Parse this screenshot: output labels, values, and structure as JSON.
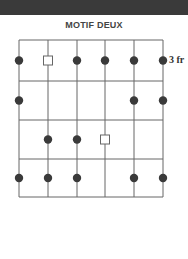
{
  "title": "MOTIF DEUX",
  "fret_label": "3 fr",
  "colors": {
    "grid": "#666666",
    "dot": "#3a3a3a",
    "topbar": "#3a3a3a"
  },
  "diagram": {
    "strings": 6,
    "frets": 4,
    "start_fret": 3,
    "positions": [
      {
        "fret": 1,
        "string": 1,
        "type": "dot"
      },
      {
        "fret": 1,
        "string": 2,
        "type": "root"
      },
      {
        "fret": 1,
        "string": 3,
        "type": "dot"
      },
      {
        "fret": 1,
        "string": 4,
        "type": "dot"
      },
      {
        "fret": 1,
        "string": 5,
        "type": "dot"
      },
      {
        "fret": 1,
        "string": 6,
        "type": "dot"
      },
      {
        "fret": 2,
        "string": 1,
        "type": "dot"
      },
      {
        "fret": 2,
        "string": 5,
        "type": "dot"
      },
      {
        "fret": 2,
        "string": 6,
        "type": "dot"
      },
      {
        "fret": 3,
        "string": 2,
        "type": "dot"
      },
      {
        "fret": 3,
        "string": 3,
        "type": "dot"
      },
      {
        "fret": 3,
        "string": 4,
        "type": "root"
      },
      {
        "fret": 4,
        "string": 1,
        "type": "dot"
      },
      {
        "fret": 4,
        "string": 2,
        "type": "dot"
      },
      {
        "fret": 4,
        "string": 3,
        "type": "dot"
      },
      {
        "fret": 4,
        "string": 5,
        "type": "dot"
      },
      {
        "fret": 4,
        "string": 6,
        "type": "dot"
      }
    ]
  }
}
